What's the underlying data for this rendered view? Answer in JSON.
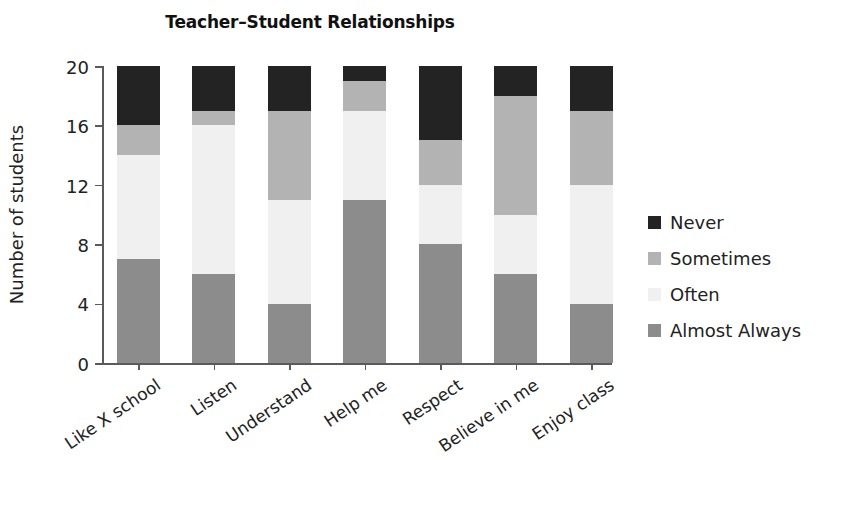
{
  "chart_data": {
    "type": "bar",
    "subtype": "stacked-bar",
    "title": "Teacher–Student Relationships",
    "xlabel": "",
    "ylabel": "Number of students",
    "ylim": [
      0,
      20
    ],
    "yticks": [
      0,
      4,
      8,
      12,
      16,
      20
    ],
    "grid": false,
    "legend_position": "right",
    "categories": [
      "Like X school",
      "Listen",
      "Understand",
      "Help me",
      "Respect",
      "Believe in me",
      "Enjoy class"
    ],
    "series": [
      {
        "name": "Almost Always",
        "color": "#8c8c8c",
        "values": [
          7,
          6,
          4,
          11,
          8,
          6,
          4
        ]
      },
      {
        "name": "Often",
        "color": "#f0f0f0",
        "values": [
          7,
          10,
          7,
          6,
          4,
          4,
          8
        ]
      },
      {
        "name": "Sometimes",
        "color": "#b3b3b3",
        "values": [
          2,
          1,
          6,
          2,
          3,
          8,
          5
        ]
      },
      {
        "name": "Never",
        "color": "#232323",
        "values": [
          4,
          3,
          3,
          1,
          5,
          2,
          3
        ]
      }
    ],
    "stack_order_bottom_to_top": [
      "Almost Always",
      "Often",
      "Sometimes",
      "Never"
    ],
    "legend_order_top_to_bottom": [
      "Never",
      "Sometimes",
      "Often",
      "Almost Always"
    ],
    "axis_color": "#5a5a5a",
    "text_color": "#222222",
    "background": "#ffffff"
  }
}
